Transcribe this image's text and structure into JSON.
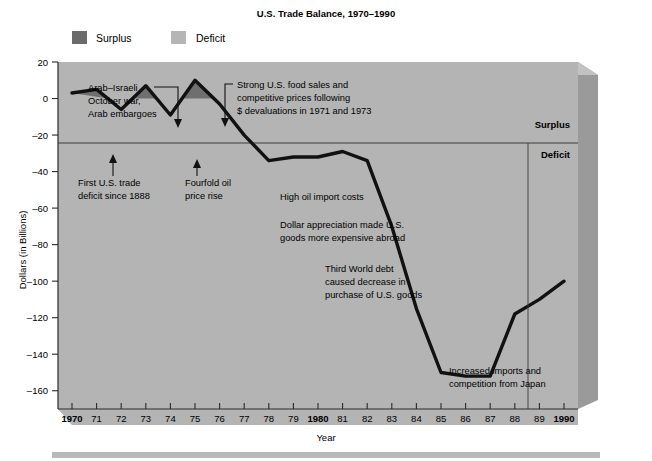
{
  "title": "U.S. Trade Balance, 1970–1990",
  "legend": [
    {
      "label": "Surplus",
      "color": "#6b6b6b"
    },
    {
      "label": "Deficit",
      "color": "#b5b5b5"
    }
  ],
  "axis": {
    "ylabel": "Dollars (in Billions)",
    "xlabel": "Year",
    "yticks": [
      "20",
      "0",
      "–20",
      "–40",
      "–60",
      "–80",
      "–100",
      "–120",
      "–140",
      "–160"
    ],
    "xticks": [
      "1970",
      "71",
      "72",
      "73",
      "74",
      "75",
      "76",
      "77",
      "78",
      "79",
      "1980",
      "81",
      "82",
      "83",
      "84",
      "85",
      "86",
      "87",
      "88",
      "89",
      "1990"
    ]
  },
  "zone_labels": {
    "surplus": "Surplus",
    "deficit": "Deficit"
  },
  "annotations": [
    {
      "name": "arab-israeli",
      "lines": [
        "Arab–Israeli",
        "October war,",
        "Arab embargoes"
      ]
    },
    {
      "name": "first-deficit",
      "lines": [
        "First U.S. trade",
        "deficit since 1888"
      ]
    },
    {
      "name": "fourfold-oil",
      "lines": [
        "Fourfold oil",
        "price rise"
      ]
    },
    {
      "name": "strong-food-sales",
      "lines": [
        "Strong U.S. food sales and",
        "competitive prices following",
        "$ devaluations in 1971 and 1973"
      ]
    },
    {
      "name": "high-oil-import",
      "lines": [
        "High oil import costs"
      ]
    },
    {
      "name": "dollar-appreciation",
      "lines": [
        "Dollar appreciation made U.S.",
        "goods more expensive abroad"
      ]
    },
    {
      "name": "third-world-debt",
      "lines": [
        "Third World debt",
        "caused decrease in",
        "purchase of U.S. goods"
      ]
    },
    {
      "name": "increased-imports",
      "lines": [
        "Increased imports and",
        "competition from Japan"
      ]
    }
  ],
  "chart_data": {
    "type": "line",
    "title": "U.S. Trade Balance, 1970–1990",
    "xlabel": "Year",
    "ylabel": "Dollars (in Billions)",
    "units": "billions of dollars",
    "x": [
      1970,
      1971,
      1972,
      1973,
      1974,
      1975,
      1976,
      1977,
      1978,
      1979,
      1980,
      1981,
      1982,
      1983,
      1984,
      1985,
      1986,
      1987,
      1988,
      1989,
      1990
    ],
    "values": [
      3,
      5,
      -6,
      7,
      -9,
      10,
      -3,
      -20,
      -34,
      -32,
      -32,
      -29,
      -34,
      -70,
      -115,
      -150,
      -152,
      -152,
      -118,
      -110,
      -100
    ],
    "ylim": [
      -170,
      20
    ],
    "xlim": [
      1970,
      1990
    ],
    "yticks": [
      20,
      0,
      -20,
      -40,
      -60,
      -80,
      -100,
      -120,
      -140,
      -160
    ],
    "grid": false,
    "legend_position": "above-plot",
    "series": [
      {
        "name": "Trade balance",
        "values": [
          3,
          5,
          -6,
          7,
          -9,
          10,
          -3,
          -20,
          -34,
          -32,
          -32,
          -29,
          -34,
          -70,
          -115,
          -150,
          -152,
          -152,
          -118,
          -110,
          -100
        ]
      }
    ],
    "fill_above_zero_label": "Surplus",
    "fill_below_zero_label": "Deficit"
  }
}
